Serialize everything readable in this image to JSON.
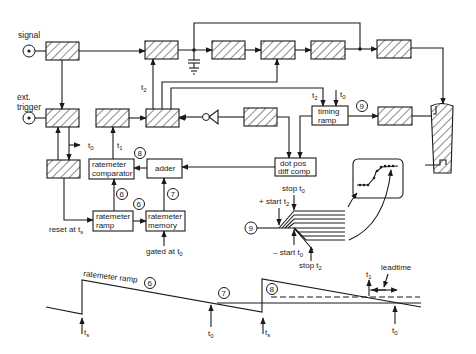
{
  "inputs": {
    "signal": "signal",
    "ext_trigger_line1": "ext.",
    "ext_trigger_line2": "trigger"
  },
  "blocks": {
    "ratemeter_comparator_line1": "ratemeter",
    "ratemeter_comparator_line2": "comparator",
    "adder": "adder",
    "ratemeter_ramp_line1": "ratemeter",
    "ratemeter_ramp_line2": "ramp",
    "ratemeter_memory_line1": "ratemeter",
    "ratemeter_memory_line2": "memory",
    "timing_ramp_line1": "timing",
    "timing_ramp_line2": "ramp",
    "dot_pos_line1": "dot pos",
    "dot_pos_line2": "diff comp"
  },
  "signals": {
    "t0": "t",
    "t0_sub": "0",
    "t1": "t",
    "t1_sub": "1",
    "t2": "t",
    "t2_sub": "2",
    "ts": "t",
    "ts_sub": "s"
  },
  "annotations": {
    "reset": "reset at t",
    "reset_sub": "s",
    "gated": "gated at t",
    "gated_sub": "0",
    "stop_t0": "stop t",
    "stop_t0_sub": "0",
    "plus_start_t2": "+ start t",
    "plus_start_t2_sub": "2",
    "minus_start_t0": "– start t",
    "minus_start_t0_sub": "0",
    "stop_t2": "stop t",
    "stop_t2_sub": "2",
    "ratemeter_ramp_wave": "ratemeter ramp",
    "leadtime": "leadtime"
  },
  "circled_numbers": {
    "n6": "6",
    "n7": "7",
    "n8": "8",
    "n9": "9"
  }
}
